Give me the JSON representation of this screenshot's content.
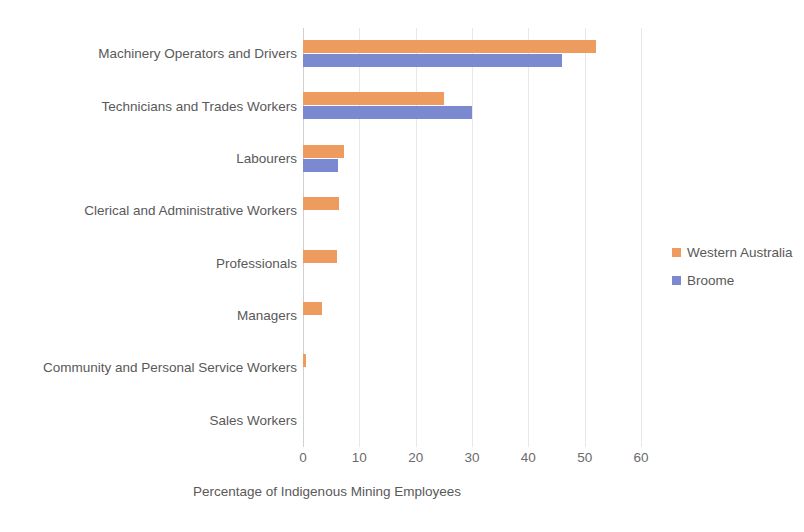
{
  "chart_data": {
    "type": "bar",
    "orientation": "horizontal",
    "title": "",
    "xlabel": "Percentage of Indigenous Mining Employees",
    "ylabel": "",
    "xlim": [
      0,
      60
    ],
    "xticks": [
      0,
      10,
      20,
      30,
      40,
      50,
      60
    ],
    "grid": "vertical",
    "legend_position": "right",
    "categories": [
      "Machinery Operators and Drivers",
      "Technicians and Trades Workers",
      "Labourers",
      "Clerical and Administrative Workers",
      "Professionals",
      "Managers",
      "Community and Personal Service Workers",
      "Sales Workers"
    ],
    "series": [
      {
        "name": "Western Australia",
        "color": "#ED9B5F",
        "values": [
          52,
          25,
          7.3,
          6.4,
          6.0,
          3.4,
          0.6,
          0
        ]
      },
      {
        "name": "Broome",
        "color": "#7B8AD0",
        "values": [
          46,
          30,
          6.2,
          0,
          0,
          0,
          0,
          0
        ]
      }
    ]
  },
  "legend": {
    "items": [
      {
        "label": "Western Australia",
        "color": "#ED9B5F"
      },
      {
        "label": "Broome",
        "color": "#7B8AD0"
      }
    ]
  },
  "axis": {
    "x_title": "Percentage of Indigenous Mining Employees",
    "x_tick_labels": [
      "0",
      "10",
      "20",
      "30",
      "40",
      "50",
      "60"
    ]
  }
}
